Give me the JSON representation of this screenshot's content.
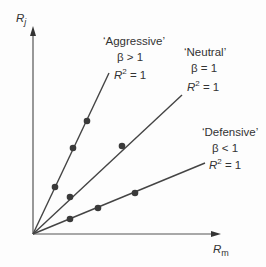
{
  "axes": {
    "y_label": "R",
    "y_sub": "j",
    "x_label": "R",
    "x_sub": "m"
  },
  "colors": {
    "line": "#444444",
    "dot": "#3a3a3a",
    "text": "#333333"
  },
  "lines": [
    {
      "name": "Aggressive",
      "title": "‘Aggressive’",
      "beta_text": "β > 1",
      "r2_base": "R",
      "r2_sup": "2",
      "r2_tail": " = 1",
      "end": [
        109,
        73
      ],
      "dots": [
        [
          55,
          187
        ],
        [
          73,
          148
        ],
        [
          87,
          121
        ]
      ]
    },
    {
      "name": "Neutral",
      "title": "‘Neutral’",
      "beta_text": "β = 1",
      "r2_base": "R",
      "r2_sup": "2",
      "r2_tail": " = 1",
      "end": [
        182,
        95
      ],
      "dots": [
        [
          70,
          197
        ],
        [
          122,
          146
        ]
      ]
    },
    {
      "name": "Defensive",
      "title": "‘Defensive’",
      "beta_text": "β < 1",
      "r2_base": "R",
      "r2_sup": "2",
      "r2_tail": " = 1",
      "end": [
        205,
        163
      ],
      "dots": [
        [
          70,
          219
        ],
        [
          98,
          208
        ],
        [
          135,
          193
        ]
      ]
    }
  ],
  "chart_data": {
    "type": "line",
    "title": "",
    "xlabel": "R_m",
    "ylabel": "R_j",
    "series": [
      {
        "name": "Aggressive",
        "annotation": "β > 1, R² = 1",
        "slope": "steep (>1)"
      },
      {
        "name": "Neutral",
        "annotation": "β = 1, R² = 1",
        "slope": "1"
      },
      {
        "name": "Defensive",
        "annotation": "β < 1, R² = 1",
        "slope": "shallow (<1)"
      }
    ],
    "grid": false,
    "legend": "inline annotations"
  }
}
